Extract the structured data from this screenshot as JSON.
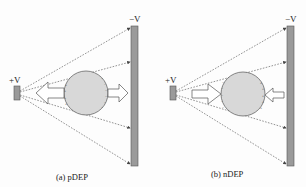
{
  "panels": [
    {
      "id": "a",
      "caption": "(a) pDEP",
      "source_electrode_label": "+V",
      "target_electrode_label": "−V",
      "force_direction": "toward-source"
    },
    {
      "id": "b",
      "caption": "(b) nDEP",
      "source_electrode_label": "+V",
      "target_electrode_label": "−V",
      "force_direction": "away-from-source"
    }
  ],
  "colors": {
    "electrode": "#9a9a9a",
    "electrode_stroke": "#555555",
    "particle": "#d6d6d6",
    "field_line": "#555555",
    "arrow_fill": "#ffffff",
    "arrow_stroke": "#555555"
  }
}
